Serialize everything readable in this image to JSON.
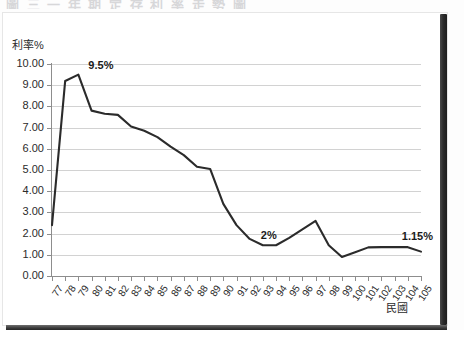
{
  "page": {
    "title_strip": "圖 三    一 年 期 定 存 利 率 走 勢 圖",
    "edge_color": "#2c2c2c"
  },
  "chart_data": {
    "type": "line",
    "title": "",
    "xlabel": "民國",
    "ylabel": "利率%",
    "ylim": [
      0,
      10
    ],
    "ytick_labels": [
      "0.00",
      "1.00",
      "2.00",
      "3.00",
      "4.00",
      "5.00",
      "6.00",
      "7.00",
      "8.00",
      "9.00",
      "10.00"
    ],
    "ytick_values": [
      0,
      1,
      2,
      3,
      4,
      5,
      6,
      7,
      8,
      9,
      10
    ],
    "grid": true,
    "legend": "none",
    "line_color": "#2b2b2b",
    "categories": [
      "77",
      "78",
      "79",
      "80",
      "81",
      "82",
      "83",
      "84",
      "85",
      "86",
      "87",
      "88",
      "89",
      "90",
      "91",
      "92",
      "93",
      "94",
      "95",
      "96",
      "97",
      "98",
      "99",
      "100",
      "101",
      "102",
      "103",
      "104",
      "105"
    ],
    "values": [
      2.4,
      9.2,
      9.5,
      7.8,
      7.65,
      7.6,
      7.05,
      6.85,
      6.55,
      6.1,
      5.7,
      5.15,
      5.05,
      3.4,
      2.4,
      1.75,
      1.45,
      1.45,
      1.8,
      2.2,
      2.6,
      1.45,
      0.9,
      1.12,
      1.35,
      1.36,
      1.36,
      1.36,
      1.15
    ],
    "annotations": [
      {
        "label": "9.5%",
        "category": "79",
        "value": 9.5
      },
      {
        "label": "2%",
        "category": "93",
        "value": 1.45
      },
      {
        "label": "1.15%",
        "category": "104",
        "value": 1.36
      }
    ]
  }
}
